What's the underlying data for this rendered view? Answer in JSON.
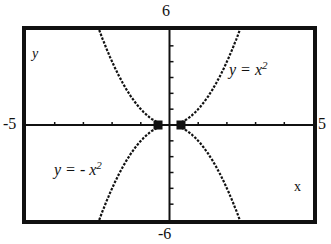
{
  "chart_data": {
    "type": "line",
    "title": "",
    "xlabel": "x",
    "ylabel": "y",
    "xlim": [
      -5,
      5
    ],
    "ylim": [
      -6,
      6
    ],
    "x_tick_step": 1,
    "y_tick_step": 1,
    "grid": false,
    "x_window_labels": {
      "min": "-5",
      "max": "5"
    },
    "y_window_labels": {
      "min": "-6",
      "max": "6"
    },
    "series": [
      {
        "name": "y = x^2",
        "equation": "y = x^2",
        "style": "dotted",
        "x": [
          -2.45,
          -2,
          -1.5,
          -1,
          -0.5,
          -0.3,
          0.3,
          0.5,
          1,
          1.5,
          2,
          2.45
        ],
        "values": [
          6,
          4,
          2.25,
          1,
          0.25,
          0.09,
          0.09,
          0.25,
          1,
          2.25,
          4,
          6
        ]
      },
      {
        "name": "y = -x^2",
        "equation": "y = -x^2",
        "style": "dotted",
        "x": [
          -2.45,
          -2,
          -1.5,
          -1,
          -0.5,
          -0.3,
          0.3,
          0.5,
          1,
          1.5,
          2,
          2.45
        ],
        "values": [
          -6,
          -4,
          -2.25,
          -1,
          -0.25,
          -0.09,
          -0.09,
          -0.25,
          -1,
          -2.25,
          -4,
          -6
        ]
      }
    ],
    "annotations": [
      {
        "text": "y = x²",
        "near_series": "y = x^2"
      },
      {
        "text": "y = - x²",
        "near_series": "y = -x^2"
      }
    ],
    "markers": [
      {
        "x": -0.4,
        "y": 0,
        "shape": "square"
      },
      {
        "x": 0.4,
        "y": 0,
        "shape": "square"
      }
    ]
  },
  "labels": {
    "y_max": "6",
    "y_min": "-6",
    "x_min": "-5",
    "x_max": "5",
    "y_axis": "y",
    "x_axis": "x",
    "upper_eq_lhs": "y = x",
    "upper_eq_exp": "2",
    "lower_eq_lhs": "y = - x",
    "lower_eq_exp": "2"
  }
}
